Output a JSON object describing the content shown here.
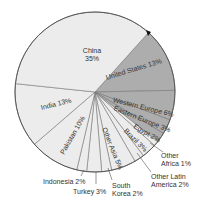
{
  "chart_data": {
    "type": "pie",
    "title": "",
    "start_angle_deg": -48,
    "direction": "clockwise",
    "center": [
      95,
      92
    ],
    "radius": 80,
    "colors": {
      "light": "#ececec",
      "dark": "#adadad",
      "edge": "#555555",
      "line": "#777777"
    },
    "slices": [
      {
        "name": "United States",
        "value": 13,
        "label": "United States 13%",
        "shade": "dark"
      },
      {
        "name": "Western Europe",
        "value": 6,
        "label": "Western Europe 6%",
        "shade": "dark"
      },
      {
        "name": "Eastern Europe",
        "value": 3,
        "label": "Eastern Europe 3%",
        "shade": "dark"
      },
      {
        "name": "Egypt",
        "value": 2,
        "label": "Egypt 2%",
        "shade": "dark"
      },
      {
        "name": "Other Africa",
        "value": 1,
        "label": "Other Africa 1%",
        "shade": "light"
      },
      {
        "name": "Brazil",
        "value": 3,
        "label": "Brazil 3%",
        "shade": "light"
      },
      {
        "name": "Other Latin America",
        "value": 2,
        "label": "Other Latin America 2%",
        "shade": "light"
      },
      {
        "name": "Other Asia",
        "value": 5,
        "label": "Other Asia 5%",
        "shade": "light"
      },
      {
        "name": "South Korea",
        "value": 2,
        "label": "South Korea 2%",
        "shade": "light"
      },
      {
        "name": "Turkey",
        "value": 3,
        "label": "Turkey 3%",
        "shade": "light"
      },
      {
        "name": "Indonesia",
        "value": 2,
        "label": "Indonesia 2%",
        "shade": "light"
      },
      {
        "name": "Pakistan",
        "value": 10,
        "label": "Pakistan 10%",
        "shade": "light"
      },
      {
        "name": "India",
        "value": 13,
        "label": "India 13%",
        "shade": "light"
      },
      {
        "name": "China",
        "value": 35,
        "label": "China 35%",
        "shade": "light"
      }
    ]
  },
  "labels": {
    "china_name": "China",
    "china_pct": "35%",
    "united_states": "United States 13%",
    "western_europe": "Western Europe 6%",
    "eastern_europe": "Eastern Europe 3%",
    "egypt": "Egypt 2%",
    "brazil": "Brazil 3%",
    "other_asia": "Other Asia 5%",
    "pakistan": "Pakistan 10%",
    "india": "India 13%",
    "other_africa_1": "Other",
    "other_africa_2": "Africa 1%",
    "other_latam_1": "Other Latin",
    "other_latam_2": "America 2%",
    "south_korea_1": "South",
    "south_korea_2": "Korea 2%",
    "turkey": "Turkey 3%",
    "indonesia": "Indonesia 2%"
  }
}
